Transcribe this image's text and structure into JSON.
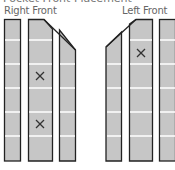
{
  "title": "Pocket Front Placement",
  "panels": [
    {
      "label": "Right Front",
      "marks": 2
    },
    {
      "label": "Left Front",
      "marks": 1
    }
  ],
  "colors": {
    "fill": "#c6c6c6",
    "stroke": "#222222",
    "gridline": "#ffffff",
    "mark": "#333333"
  },
  "mark_symbol": "×"
}
